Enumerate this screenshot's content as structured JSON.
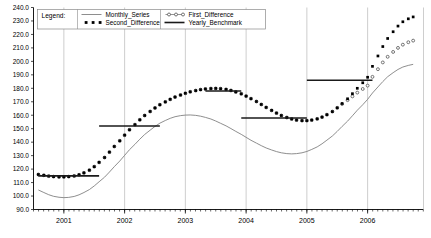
{
  "chart_data": {
    "type": "line",
    "title": "",
    "xlabel": "",
    "ylabel": "",
    "xlim": [
      2000.5,
      2006.92
    ],
    "ylim": [
      90.0,
      240.0
    ],
    "grid": true,
    "grid_axis": "x",
    "legend": {
      "position": "top-left-inside",
      "title": "Legend:",
      "entries": [
        {
          "name": "Monthly_Series",
          "marker": "none",
          "line": "solid-thin",
          "color": "#666666"
        },
        {
          "name": "Second_Difference",
          "marker": "filled-square",
          "line": "dotted",
          "color": "#000000"
        },
        {
          "name": "First_Difference",
          "marker": "open-circle",
          "line": "dotted",
          "color": "#555555"
        },
        {
          "name": "Yearly_Benchmark",
          "marker": "none",
          "line": "solid-thick",
          "color": "#222222"
        }
      ]
    },
    "yticks": [
      90.0,
      100.0,
      110.0,
      120.0,
      130.0,
      140.0,
      150.0,
      160.0,
      170.0,
      180.0,
      190.0,
      200.0,
      210.0,
      220.0,
      230.0,
      240.0
    ],
    "ytick_labels": [
      "90.0",
      "100.0",
      "110.0",
      "120.0",
      "130.0",
      "140.0",
      "150.0",
      "160.0",
      "170.0",
      "180.0",
      "190.0",
      "200.0",
      "210.0",
      "220.0",
      "230.0",
      "240.0"
    ],
    "xticks": [
      2001,
      2002,
      2003,
      2004,
      2005,
      2006
    ],
    "xtick_labels": [
      "2001",
      "2002",
      "2003",
      "2004",
      "2005",
      "2006"
    ],
    "x": [
      2000.58,
      2000.67,
      2000.75,
      2000.83,
      2000.92,
      2001.0,
      2001.08,
      2001.17,
      2001.25,
      2001.33,
      2001.42,
      2001.5,
      2001.58,
      2001.67,
      2001.75,
      2001.83,
      2001.92,
      2002.0,
      2002.08,
      2002.17,
      2002.25,
      2002.33,
      2002.42,
      2002.5,
      2002.58,
      2002.67,
      2002.75,
      2002.83,
      2002.92,
      2003.0,
      2003.08,
      2003.17,
      2003.25,
      2003.33,
      2003.42,
      2003.5,
      2003.58,
      2003.67,
      2003.75,
      2003.83,
      2003.92,
      2004.0,
      2004.08,
      2004.17,
      2004.25,
      2004.33,
      2004.42,
      2004.5,
      2004.58,
      2004.67,
      2004.75,
      2004.83,
      2004.92,
      2005.0,
      2005.08,
      2005.17,
      2005.25,
      2005.33,
      2005.42,
      2005.5,
      2005.58,
      2005.67,
      2005.75,
      2005.83,
      2005.92,
      2006.0,
      2006.08,
      2006.17,
      2006.25,
      2006.33,
      2006.42,
      2006.5,
      2006.58,
      2006.67,
      2006.75
    ],
    "series": [
      {
        "name": "Second_Difference",
        "style": "filled-square-dotted",
        "values": [
          116.0,
          115.4,
          114.8,
          114.4,
          114.2,
          114.2,
          114.4,
          114.9,
          115.8,
          117.2,
          119.2,
          121.8,
          125.0,
          128.6,
          132.6,
          136.8,
          141.0,
          145.2,
          149.2,
          153.0,
          156.6,
          159.8,
          162.8,
          165.4,
          167.8,
          169.9,
          171.8,
          173.5,
          175.0,
          176.3,
          177.4,
          178.3,
          179.0,
          179.5,
          179.8,
          179.9,
          179.7,
          179.2,
          178.4,
          177.3,
          175.9,
          174.2,
          172.3,
          170.2,
          168.0,
          165.8,
          163.6,
          161.6,
          159.8,
          158.3,
          157.2,
          156.4,
          156.0,
          156.0,
          156.4,
          157.3,
          158.6,
          160.4,
          162.7,
          165.5,
          168.7,
          172.2,
          176.0,
          180.0,
          184.1,
          188.2,
          196.3,
          204.0,
          211.0,
          217.0,
          222.0,
          226.2,
          229.4,
          231.6,
          233.0
        ]
      },
      {
        "name": "First_Difference",
        "style": "open-circle-dotted",
        "values": [
          116.0,
          115.4,
          114.8,
          114.4,
          114.2,
          114.2,
          114.4,
          114.9,
          115.8,
          117.2,
          119.2,
          121.8,
          125.0,
          128.6,
          132.6,
          136.8,
          141.0,
          145.2,
          149.2,
          153.0,
          156.6,
          159.8,
          162.8,
          165.4,
          167.8,
          169.9,
          171.8,
          173.5,
          175.0,
          176.3,
          177.4,
          178.3,
          179.0,
          179.5,
          179.8,
          179.9,
          179.7,
          179.2,
          178.4,
          177.3,
          175.9,
          174.2,
          172.3,
          170.2,
          168.0,
          165.8,
          163.6,
          161.6,
          159.8,
          158.3,
          157.2,
          156.4,
          156.0,
          156.0,
          156.4,
          157.3,
          158.6,
          160.4,
          162.7,
          165.5,
          168.3,
          171.2,
          174.0,
          176.8,
          179.5,
          182.0,
          188.5,
          194.2,
          199.2,
          203.4,
          207.0,
          210.0,
          212.4,
          214.2,
          215.4
        ]
      },
      {
        "name": "Monthly_Series",
        "style": "thin-line",
        "values": [
          104.5,
          102.6,
          101.0,
          99.8,
          99.1,
          98.8,
          99.0,
          99.7,
          100.9,
          102.6,
          104.8,
          107.5,
          110.6,
          114.0,
          117.8,
          121.8,
          126.0,
          130.2,
          134.4,
          138.4,
          142.2,
          145.7,
          148.9,
          151.7,
          154.1,
          156.1,
          157.7,
          158.9,
          159.7,
          160.1,
          160.2,
          159.9,
          159.3,
          158.4,
          157.2,
          155.7,
          154.0,
          152.1,
          150.1,
          148.0,
          145.8,
          143.6,
          141.4,
          139.3,
          137.4,
          135.7,
          134.2,
          133.0,
          132.1,
          131.5,
          131.3,
          131.5,
          132.1,
          133.1,
          134.6,
          136.5,
          138.8,
          141.5,
          144.6,
          148.0,
          151.7,
          155.6,
          159.6,
          163.7,
          167.8,
          171.8,
          176.5,
          181.0,
          185.0,
          188.6,
          191.6,
          194.0,
          195.8,
          197.0,
          197.8
        ]
      }
    ],
    "benchmark_segments": [
      {
        "x0": 2000.58,
        "x1": 2001.58,
        "value": 115.0
      },
      {
        "x0": 2001.58,
        "x1": 2002.58,
        "value": 152.0
      },
      {
        "x0": 2003.33,
        "x1": 2003.92,
        "value": 178.0
      },
      {
        "x0": 2003.92,
        "x1": 2005.0,
        "value": 158.0
      },
      {
        "x0": 2005.0,
        "x1": 2006.08,
        "value": 186.0
      }
    ]
  }
}
